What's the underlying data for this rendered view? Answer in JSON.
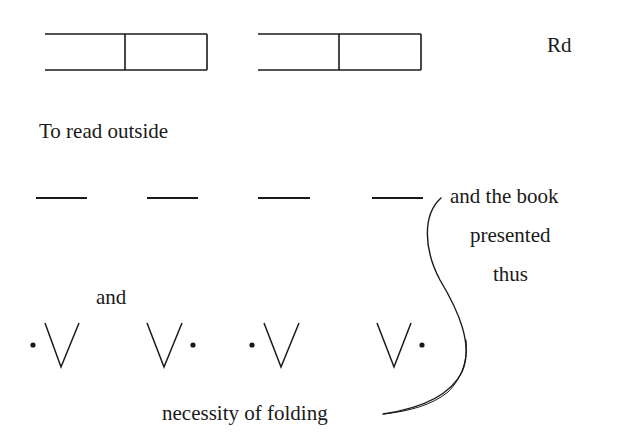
{
  "diagram": {
    "background": "#ffffff",
    "ink": "#1a1a1a",
    "labels": {
      "corner": "Rd",
      "read_outside": "To read outside",
      "book_line1": "and the book",
      "book_line2": "presented",
      "book_line3": "thus",
      "and": "and",
      "folding": "necessity of folding"
    },
    "boxes": [
      {
        "left": 45,
        "divider": 125,
        "right": 207,
        "top": 34,
        "bottom": 70
      },
      {
        "left": 258,
        "divider": 339,
        "right": 421,
        "top": 34,
        "bottom": 70
      }
    ],
    "dashes": [
      {
        "x1": 36,
        "x2": 87,
        "y": 198
      },
      {
        "x1": 147,
        "x2": 198,
        "y": 198
      },
      {
        "x1": 258,
        "x2": 310,
        "y": 198
      },
      {
        "x1": 372,
        "x2": 423,
        "y": 198
      }
    ],
    "folds": [
      {
        "dot": "left",
        "dot_x": 33,
        "v_left": 45,
        "v_bottom": 61,
        "v_right": 79
      },
      {
        "dot": "right",
        "dot_x": 193,
        "v_left": 147,
        "v_bottom": 164,
        "v_right": 182
      },
      {
        "dot": "left",
        "dot_x": 252,
        "v_left": 264,
        "v_bottom": 281,
        "v_right": 299
      },
      {
        "dot": "right",
        "dot_x": 422,
        "v_left": 377,
        "v_bottom": 394,
        "v_right": 411
      }
    ]
  }
}
